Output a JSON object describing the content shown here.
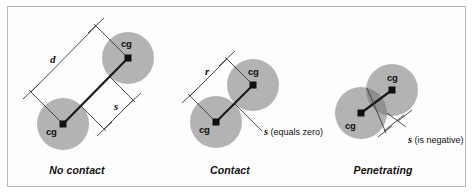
{
  "figure": {
    "border_color": "#b9b9b9",
    "background": "#ffffff",
    "width": 473,
    "height": 196
  },
  "style": {
    "circle_fill": "#b3b3b3",
    "circle_overlap_fill": "#8f8f8f",
    "line_color": "#1a1a1a",
    "dim_line_color": "#3a3a3a",
    "text_color": "#101010"
  },
  "panels": [
    {
      "id": "no-contact",
      "caption": "No contact",
      "circles": [
        {
          "name": "circle-lower-left",
          "cx": 63,
          "cy": 124,
          "r": 26
        },
        {
          "name": "circle-upper-right",
          "cx": 128,
          "cy": 58,
          "r": 26
        }
      ],
      "cg_labels": [
        {
          "name": "cg-label-lower-left",
          "text": "cg",
          "x": 48,
          "y": 128
        },
        {
          "name": "cg-label-upper-right",
          "text": "cg",
          "x": 122,
          "y": 42
        }
      ],
      "dimensions": [
        {
          "name": "dimension-d",
          "symbol": "d",
          "label_x": 54,
          "label_y": 60,
          "meaning": "center-to-center distance"
        },
        {
          "name": "dimension-s",
          "symbol": "s",
          "label_x": 117,
          "label_y": 105,
          "meaning": "separation gap, positive"
        }
      ]
    },
    {
      "id": "contact",
      "caption": "Contact",
      "circles": [
        {
          "name": "circle-lower-left",
          "cx": 216,
          "cy": 122,
          "r": 26
        },
        {
          "name": "circle-upper-right",
          "cx": 253,
          "cy": 85,
          "r": 26
        }
      ],
      "cg_labels": [
        {
          "name": "cg-label-lower-left",
          "text": "cg",
          "x": 201,
          "y": 128
        },
        {
          "name": "cg-label-upper-right",
          "text": "cg",
          "x": 250,
          "y": 70
        }
      ],
      "dimensions": [
        {
          "name": "dimension-r",
          "symbol": "r",
          "label_x": 209,
          "label_y": 72,
          "meaning": "sum of radii"
        },
        {
          "name": "dimension-s",
          "symbol": "s",
          "suffix": " (equals zero)",
          "label_x": 262,
          "label_y": 124,
          "meaning": "separation gap is zero"
        }
      ]
    },
    {
      "id": "penetrating",
      "caption": "Penetrating",
      "circles": [
        {
          "name": "circle-lower-left",
          "cx": 361,
          "cy": 113,
          "r": 26
        },
        {
          "name": "circle-upper-right",
          "cx": 392,
          "cy": 90,
          "r": 26
        }
      ],
      "cg_labels": [
        {
          "name": "cg-label-lower-left",
          "text": "cg",
          "x": 347,
          "y": 124
        },
        {
          "name": "cg-label-upper-right",
          "text": "cg",
          "x": 389,
          "y": 76
        }
      ],
      "dimensions": [
        {
          "name": "dimension-s",
          "symbol": "s",
          "suffix": " (is negative)",
          "label_x": 406,
          "label_y": 133,
          "meaning": "separation gap is negative (overlap)"
        }
      ]
    }
  ],
  "labels": {
    "cg": "cg",
    "d": "d",
    "r": "r",
    "s": "s",
    "s_equals_zero_suffix": " (equals zero)",
    "s_is_negative_suffix": " (is negative)",
    "caption_no_contact": "No contact",
    "caption_contact": "Contact",
    "caption_penetrating": "Penetrating"
  }
}
